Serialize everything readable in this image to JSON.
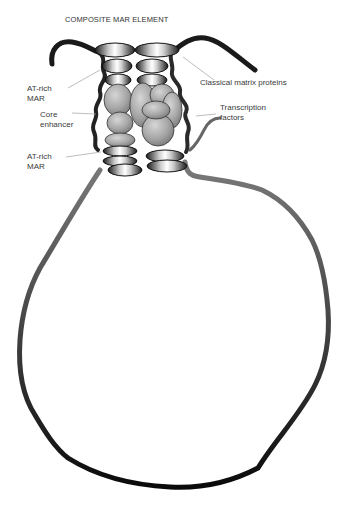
{
  "figure": {
    "title": "COMPOSITE MAR ELEMENT",
    "labels": {
      "at_rich_mar_top": "AT-rich\nMAR",
      "core_enhancer": "Core\nenhancer",
      "at_rich_mar_bottom": "AT-rich\nMAR",
      "classical_matrix_proteins": "Classical matrix proteins",
      "transcription_factors": "Transcription\nfactors"
    },
    "colors": {
      "strand_dark": "#1a1a1a",
      "strand_loop_light": "#777777",
      "strand_loop_dark": "#0d0d0d",
      "protein_fill": "#a8a8a8",
      "protein_outline": "#333333",
      "leader_line": "#9a9a9a"
    },
    "components": [
      "DNA strand (dark) curling at top",
      "Classical matrix protein ellipses (3 rows, 2 columns)",
      "Transcription factor blobs",
      "AT-rich MAR rings (bottom)",
      "Chromatin loop"
    ]
  }
}
